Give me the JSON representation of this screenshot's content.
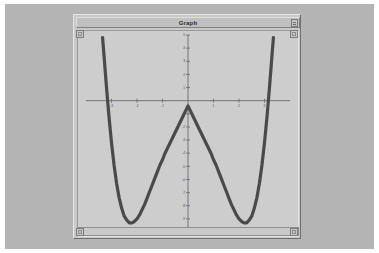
{
  "window": {
    "title": "Graph",
    "control_icon": "window-control-icon",
    "scroll_icon": "scroll-up-arrow-icon"
  },
  "chart_data": {
    "type": "line",
    "title": "",
    "xlabel": "",
    "ylabel": "",
    "xlim": [
      -4,
      4
    ],
    "ylim": [
      -10,
      5
    ],
    "grid": false,
    "legend": null,
    "x_ticks": [
      -3,
      -2,
      -1,
      1,
      2,
      3
    ],
    "x_tick_labels": [
      "-3",
      "-2",
      "-1",
      "1",
      "2",
      "3"
    ],
    "y_ticks": [
      5,
      4,
      3,
      2,
      1,
      -1,
      -2,
      -3,
      -4,
      -5,
      -6,
      -7,
      -8,
      -9,
      -10
    ],
    "y_tick_labels": [
      "5",
      "4",
      "3",
      "2",
      "1",
      "-1",
      "-2",
      "-3",
      "-4",
      "-5",
      "-6",
      "-7",
      "-8",
      "-9",
      "-10"
    ],
    "curve_color": "#4a4a4a",
    "axis_color": "#6b6b6b",
    "roots": [
      -3,
      -1,
      1,
      3
    ],
    "local_minima": [
      {
        "x": -2.24,
        "y": -4.0
      },
      {
        "x": 2.24,
        "y": -4.0
      }
    ],
    "local_maximum": {
      "x": 0,
      "y": 4.0
    },
    "series": [
      {
        "name": "y = x^4 - 10x^2 + 9",
        "x": [
          -3.35,
          -3.3,
          -3.2,
          -3.1,
          -3.0,
          -2.9,
          -2.8,
          -2.7,
          -2.6,
          -2.5,
          -2.4,
          -2.3,
          -2.2,
          -2.1,
          -2.0,
          -1.9,
          -1.8,
          -1.7,
          -1.6,
          -1.5,
          -1.4,
          -1.3,
          -1.2,
          -1.1,
          -1.0,
          -0.9,
          -0.8,
          -0.7,
          -0.6,
          -0.5,
          -0.4,
          -0.3,
          -0.2,
          -0.1,
          0.0,
          0.1,
          0.2,
          0.3,
          0.4,
          0.5,
          0.6,
          0.7,
          0.8,
          0.9,
          1.0,
          1.1,
          1.2,
          1.3,
          1.4,
          1.5,
          1.6,
          1.7,
          1.8,
          1.9,
          2.0,
          2.1,
          2.2,
          2.3,
          2.4,
          2.5,
          2.6,
          2.7,
          2.8,
          2.9,
          3.0,
          3.1,
          3.2,
          3.3,
          3.35
        ],
        "y": [
          4.8,
          3.6,
          1.1,
          -1.2,
          -3.2,
          -4.9,
          -6.3,
          -7.4,
          -8.2,
          -8.8,
          -9.1,
          -9.3,
          -9.3,
          -9.2,
          -9.0,
          -8.7,
          -8.3,
          -7.9,
          -7.4,
          -6.9,
          -6.4,
          -5.9,
          -5.4,
          -4.9,
          -4.5,
          -4.0,
          -3.6,
          -3.2,
          -2.8,
          -2.4,
          -2.0,
          -1.6,
          -1.2,
          -0.8,
          -0.4,
          -0.8,
          -1.2,
          -1.6,
          -2.0,
          -2.4,
          -2.8,
          -3.2,
          -3.6,
          -4.0,
          -4.5,
          -4.9,
          -5.4,
          -5.9,
          -6.4,
          -6.9,
          -7.4,
          -7.9,
          -8.3,
          -8.7,
          -9.0,
          -9.2,
          -9.3,
          -9.3,
          -9.1,
          -8.8,
          -8.2,
          -7.4,
          -6.3,
          -4.9,
          -3.2,
          -1.2,
          1.1,
          3.6,
          4.8
        ]
      }
    ]
  }
}
